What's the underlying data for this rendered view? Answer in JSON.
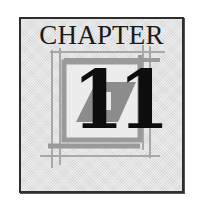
{
  "emblem": {
    "title": "CHAPTER",
    "number": "11",
    "icon": "chapter-frame-emblem"
  },
  "colors": {
    "border": "#2e2e2e",
    "background": "#e4e4e4",
    "frame_thin": "#a8a8a8",
    "frame_thick": "#9a9a9a",
    "diagonal_band": "#8c8c8c",
    "inner_square": "#ececec",
    "numeral": "#0d0d0d"
  }
}
